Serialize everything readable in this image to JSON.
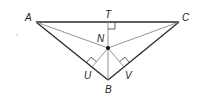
{
  "diagram": {
    "type": "triangle-incenter",
    "points": {
      "A": {
        "label": "A",
        "x": 36,
        "y": 22
      },
      "C": {
        "label": "C",
        "x": 179,
        "y": 22
      },
      "B": {
        "label": "B",
        "x": 108,
        "y": 80
      },
      "T": {
        "label": "T",
        "x": 108,
        "y": 22
      },
      "N": {
        "label": "N",
        "x": 108,
        "y": 48
      },
      "U": {
        "label": "U",
        "x": 92,
        "y": 67
      },
      "V": {
        "label": "V",
        "x": 124,
        "y": 67
      }
    },
    "labels": {
      "A": "A",
      "T": "T",
      "C": "C",
      "N": "N",
      "U": "U",
      "V": "V",
      "B": "B"
    },
    "segments": [
      {
        "from": "A",
        "to": "C",
        "style": "main"
      },
      {
        "from": "A",
        "to": "B",
        "style": "main"
      },
      {
        "from": "C",
        "to": "B",
        "style": "main"
      },
      {
        "from": "A",
        "to": "N",
        "style": "thin"
      },
      {
        "from": "C",
        "to": "N",
        "style": "thin"
      },
      {
        "from": "T",
        "to": "B",
        "style": "thin"
      },
      {
        "from": "N",
        "to": "U",
        "style": "thin"
      },
      {
        "from": "N",
        "to": "V",
        "style": "thin"
      }
    ],
    "right_angles": [
      "T",
      "U",
      "V"
    ],
    "marked_point": "N",
    "colors": {
      "line": "#2a2a2a",
      "thin_line": "#7a7a7a",
      "background": "#ffffff"
    }
  }
}
